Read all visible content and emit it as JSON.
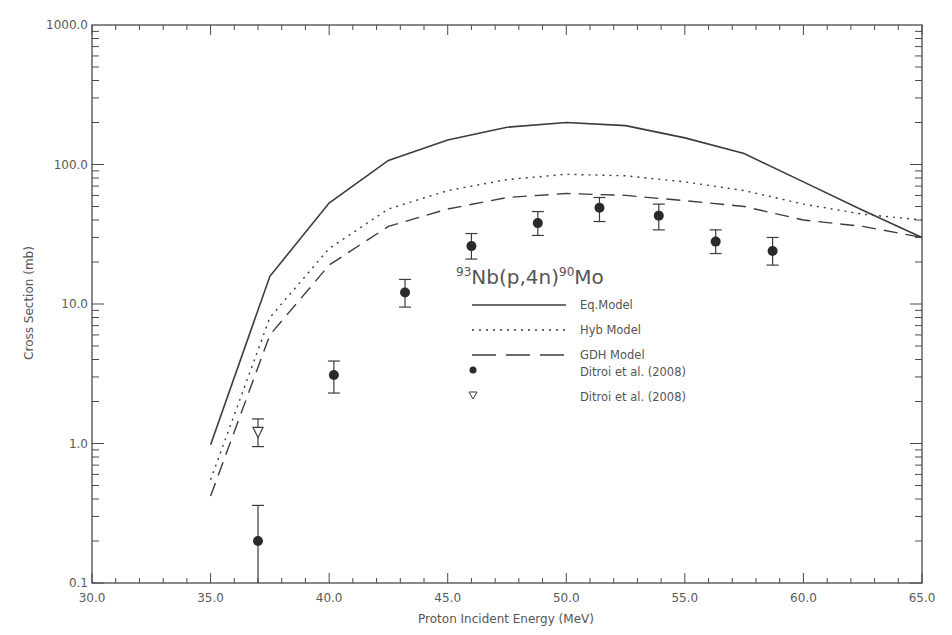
{
  "chart_data": {
    "type": "line",
    "title": "93Nb(p,4n)90Mo",
    "reaction": {
      "pre_sup": "93",
      "mid": "Nb(p,4n)",
      "post_sup": "90",
      "post": "Mo"
    },
    "xlabel": "Proton Incident Energy (MeV)",
    "ylabel": "Cross Section (mb)",
    "xlim": [
      30.0,
      65.0
    ],
    "ylim": [
      0.1,
      1000.0
    ],
    "yscale": "log",
    "grid": false,
    "legend_position": "center (inside plot)",
    "x_ticks": [
      "30.0",
      "35.0",
      "40.0",
      "45.0",
      "50.0",
      "55.0",
      "60.0",
      "65.0"
    ],
    "y_ticks": [
      "0.1",
      "1.0",
      "10.0",
      "100.0",
      "1000.0"
    ],
    "x": [
      35.0,
      37.5,
      40.0,
      42.5,
      45.0,
      47.5,
      50.0,
      52.5,
      55.0,
      57.5,
      60.0,
      62.5,
      65.0
    ],
    "series": [
      {
        "name": "Eq.Model",
        "style": "solid",
        "values": [
          0.98,
          15.8,
          53,
          107,
          150,
          185,
          200,
          190,
          155,
          120,
          75,
          47,
          30
        ]
      },
      {
        "name": "Hyb Model",
        "style": "dotted",
        "values": [
          0.55,
          8,
          25,
          48,
          65,
          78,
          85,
          83,
          75,
          65,
          52,
          44,
          40
        ]
      },
      {
        "name": "GDH Model",
        "style": "dashed",
        "values": [
          0.42,
          6,
          19,
          36,
          48,
          58,
          62,
          60,
          55,
          50,
          40,
          36,
          30
        ]
      }
    ],
    "points": [
      {
        "name": "Ditroi et al. (2008)",
        "marker": "filled-circle",
        "data": [
          {
            "x": 37.0,
            "y": 0.2,
            "lo": 0.1,
            "hi": 0.36
          },
          {
            "x": 40.2,
            "y": 3.1,
            "lo": 2.3,
            "hi": 3.9
          },
          {
            "x": 43.2,
            "y": 12.1,
            "lo": 9.5,
            "hi": 15
          },
          {
            "x": 46.0,
            "y": 26,
            "lo": 21,
            "hi": 32
          },
          {
            "x": 48.8,
            "y": 38,
            "lo": 31,
            "hi": 46
          },
          {
            "x": 51.4,
            "y": 49,
            "lo": 39,
            "hi": 58
          },
          {
            "x": 53.9,
            "y": 43,
            "lo": 34,
            "hi": 52
          },
          {
            "x": 56.3,
            "y": 28,
            "lo": 23,
            "hi": 34
          },
          {
            "x": 58.7,
            "y": 24,
            "lo": 19,
            "hi": 30
          }
        ]
      },
      {
        "name": "Ditroi et al. (2008)",
        "marker": "open-triangle-down",
        "data": [
          {
            "x": 37.0,
            "y": 1.2,
            "lo": 0.95,
            "hi": 1.5
          }
        ]
      }
    ],
    "legend": [
      {
        "label": "Eq.Model",
        "kind": "solid"
      },
      {
        "label": "Hyb Model",
        "kind": "dotted"
      },
      {
        "label": "GDH Model",
        "kind": "dashed"
      },
      {
        "label": "Ditroi et al. (2008)",
        "kind": "filled-circle"
      },
      {
        "label": "Ditroi et al. (2008)",
        "kind": "open-triangle-down"
      }
    ],
    "colors": {
      "line": "#3c3c3c",
      "axis": "#4a4a4a",
      "text": "#555555"
    }
  }
}
